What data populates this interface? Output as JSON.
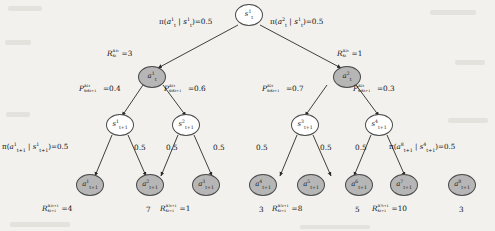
{
  "diagram": {
    "colors": {
      "background": "#f2f1ee",
      "state_node_fill": "#ffffff",
      "action_node_fill": "#b6b6b6",
      "stroke": "#4a4a4a",
      "text": "#111111"
    },
    "root": {
      "label": "s",
      "sup": "1",
      "sub": "t"
    },
    "action_level": [
      {
        "label": "a",
        "sup": "1",
        "sub": "t"
      },
      {
        "label": "a",
        "sup": "2",
        "sub": "t"
      }
    ],
    "state_level": [
      {
        "label": "s",
        "sup": "1",
        "sub": "t+1"
      },
      {
        "label": "s",
        "sup": "2",
        "sub": "t+1"
      },
      {
        "label": "s",
        "sup": "3",
        "sub": "t+1"
      },
      {
        "label": "s",
        "sup": "4",
        "sub": "t+1"
      }
    ],
    "leaf_actions": [
      {
        "label": "a",
        "sup": "1",
        "sub": "t+1"
      },
      {
        "label": "a",
        "sup": "2",
        "sub": "t+1"
      },
      {
        "label": "a",
        "sup": "3",
        "sub": "t+1"
      },
      {
        "label": "a",
        "sup": "4",
        "sub": "t+1"
      },
      {
        "label": "a",
        "sup": "5",
        "sub": "t+1"
      },
      {
        "label": "a",
        "sup": "6",
        "sub": "t+1"
      },
      {
        "label": "a",
        "sup": "7",
        "sub": "t+1"
      },
      {
        "label": "a",
        "sup": "8",
        "sub": "t+1"
      }
    ],
    "policy_top": [
      {
        "text": "π(a",
        "sup": "1",
        "sub": "t",
        "mid": " | s",
        "sup2": "1",
        "sub2": "t",
        "value": "0.5"
      },
      {
        "text": "π(a",
        "sup": "2",
        "sub": "t",
        "mid": " | s",
        "sup2": "1",
        "sub2": "t",
        "value": "0.5"
      }
    ],
    "rewards_top": [
      {
        "value": "3"
      },
      {
        "value": "1"
      }
    ],
    "transitions": [
      {
        "value": "0.4"
      },
      {
        "value": "0.6"
      },
      {
        "value": "0.7"
      },
      {
        "value": "0.3"
      }
    ],
    "policy_bottom_full_left": {
      "value": "0.5"
    },
    "policy_bottom_full_right": {
      "value": "0.5"
    },
    "policy_bottom_short": [
      "0.5",
      "0.5",
      "0.5",
      "0.5",
      "0.5",
      "0.5"
    ],
    "rewards_bottom": [
      {
        "full": true,
        "value": "4"
      },
      {
        "full": false,
        "value": "7"
      },
      {
        "full": true,
        "value": "1"
      },
      {
        "full": false,
        "value": "3"
      },
      {
        "full": true,
        "value": "8"
      },
      {
        "full": false,
        "value": "5"
      },
      {
        "full": true,
        "value": "10"
      },
      {
        "full": false,
        "value": "3"
      }
    ]
  }
}
